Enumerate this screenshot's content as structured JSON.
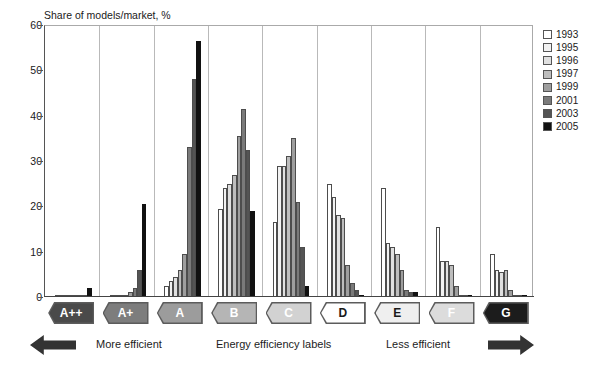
{
  "chart_data": {
    "type": "bar",
    "title": "Share of models/market, %",
    "xlabel": "Energy efficiency labels",
    "ylabel": "",
    "ylim": [
      0,
      60
    ],
    "yticks": [
      0,
      10,
      20,
      30,
      40,
      50,
      60
    ],
    "grid": "vertical",
    "legend_position": "right",
    "categories": [
      "A++",
      "A+",
      "A",
      "B",
      "C",
      "D",
      "E",
      "F",
      "G"
    ],
    "series": [
      {
        "name": "1993",
        "color": "#ffffff",
        "values": [
          0.0,
          0.0,
          2.5,
          19.5,
          16.5,
          25.0,
          24.0,
          15.5,
          9.5
        ]
      },
      {
        "name": "1995",
        "color": "#f2f2f2",
        "values": [
          0.0,
          0.0,
          3.5,
          24.0,
          29.0,
          22.0,
          12.0,
          8.0,
          6.0
        ]
      },
      {
        "name": "1996",
        "color": "#e0e0e0",
        "values": [
          0.0,
          0.0,
          4.5,
          25.0,
          29.0,
          18.0,
          11.0,
          8.0,
          5.5
        ]
      },
      {
        "name": "1997",
        "color": "#bdbdbd",
        "values": [
          0.0,
          0.3,
          6.0,
          27.0,
          31.0,
          17.5,
          9.5,
          7.0,
          6.0
        ]
      },
      {
        "name": "1999",
        "color": "#9e9e9e",
        "values": [
          0.0,
          1.0,
          9.5,
          35.5,
          35.0,
          7.0,
          6.0,
          2.5,
          1.5
        ]
      },
      {
        "name": "2001",
        "color": "#7a7a7a",
        "values": [
          0.0,
          2.0,
          33.0,
          41.5,
          21.0,
          3.0,
          1.5,
          0.5,
          0.3
        ]
      },
      {
        "name": "2003",
        "color": "#545454",
        "values": [
          0.5,
          6.0,
          48.0,
          32.5,
          11.0,
          1.5,
          1.0,
          0.3,
          0.2
        ]
      },
      {
        "name": "2005",
        "color": "#111111",
        "values": [
          2.0,
          20.5,
          56.5,
          19.0,
          2.5,
          0.5,
          1.2,
          0.0,
          0.3
        ]
      }
    ]
  },
  "legend": {
    "items": [
      {
        "label": "1993",
        "color": "#ffffff"
      },
      {
        "label": "1995",
        "color": "#f2f2f2"
      },
      {
        "label": "1996",
        "color": "#e0e0e0"
      },
      {
        "label": "1997",
        "color": "#bdbdbd"
      },
      {
        "label": "1999",
        "color": "#9e9e9e"
      },
      {
        "label": "2001",
        "color": "#7a7a7a"
      },
      {
        "label": "2003",
        "color": "#545454"
      },
      {
        "label": "2005",
        "color": "#111111"
      }
    ]
  },
  "axis_badges": [
    {
      "label": "A++",
      "fill": "#4a4a4a",
      "text": "#ffffff"
    },
    {
      "label": "A+",
      "fill": "#7d7d7d",
      "text": "#ffffff"
    },
    {
      "label": "A",
      "fill": "#9c9c9c",
      "text": "#ffffff"
    },
    {
      "label": "B",
      "fill": "#b5b5b5",
      "text": "#ffffff"
    },
    {
      "label": "C",
      "fill": "#d2d2d2",
      "text": "#ffffff"
    },
    {
      "label": "D",
      "fill": "#ffffff",
      "text": "#1a1a1a"
    },
    {
      "label": "E",
      "fill": "#efefef",
      "text": "#1a1a1a"
    },
    {
      "label": "F",
      "fill": "#dcdcdc",
      "text": "#ffffff"
    },
    {
      "label": "G",
      "fill": "#1c1c1c",
      "text": "#ffffff"
    }
  ],
  "footer": {
    "more_efficient": "More efficient",
    "axis_caption": "Energy efficiency labels",
    "less_efficient": "Less efficient",
    "left_arrow_icon": "arrow-left-icon",
    "right_arrow_icon": "arrow-right-icon"
  }
}
